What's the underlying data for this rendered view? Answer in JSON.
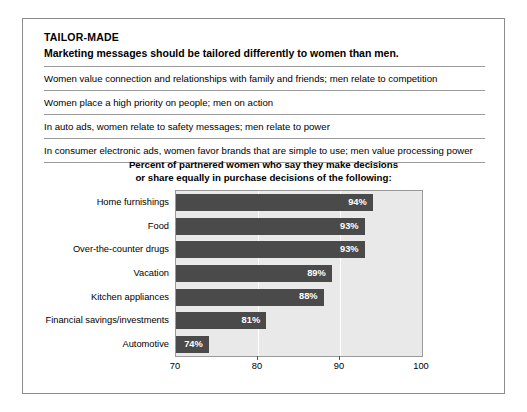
{
  "exhibit": {
    "kicker": "TAILOR-MADE",
    "subhead": "Marketing messages should be tailored differently to women than men.",
    "facts": [
      "Women value connection and relationships with family and friends; men relate to competition",
      "Women place a high priority on people; men on action",
      "In auto ads, women relate to safety messages; men relate to power",
      "In consumer electronic ads, women favor brands that are simple to use; men value processing power"
    ]
  },
  "chart_data": {
    "type": "bar",
    "orientation": "horizontal",
    "title": "Percent of partnered women who say they make decisions or share equally in purchase decisions of the following:",
    "title_line1": "Percent of partnered women who say they make decisions",
    "title_line2": "or share equally in purchase decisions of the following:",
    "categories": [
      "Home furnishings",
      "Food",
      "Over-the-counter drugs",
      "Vacation",
      "Kitchen appliances",
      "Financial savings/investments",
      "Automotive"
    ],
    "values": [
      94,
      93,
      93,
      89,
      88,
      81,
      74
    ],
    "value_labels": [
      "94%",
      "93%",
      "93%",
      "89%",
      "88%",
      "81%",
      "74%"
    ],
    "xlabel": "",
    "ylabel": "",
    "xlim": [
      70,
      100
    ],
    "xticks": [
      70,
      80,
      90,
      100
    ],
    "xtick_labels": [
      "70",
      "80",
      "90",
      "100"
    ],
    "grid": true,
    "gridlines_at": [
      80,
      90
    ],
    "legend": "none",
    "bar_color": "#4a4a4a",
    "plot_background": "#e9e9e9",
    "value_label_color": "#ffffff"
  }
}
